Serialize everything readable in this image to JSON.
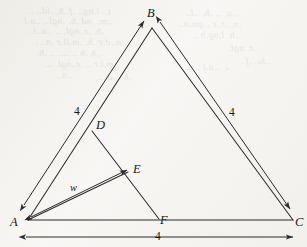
{
  "figure": {
    "kind": "geometry-diagram",
    "background_color": "#f7f6f4",
    "ink_color": "#2b2a2e",
    "vertices": [
      {
        "id": "A",
        "label": "A",
        "x": 28,
        "y": 220,
        "label_x": 10,
        "label_y": 216
      },
      {
        "id": "B",
        "label": "B",
        "x": 152,
        "y": 28,
        "label_x": 147,
        "label_y": 7
      },
      {
        "id": "C",
        "label": "C",
        "x": 293,
        "y": 220,
        "label_x": 295,
        "label_y": 216
      },
      {
        "id": "D",
        "label": "D",
        "x": 92,
        "y": 131,
        "label_x": 96,
        "label_y": 119
      },
      {
        "id": "E",
        "label": "E",
        "x": 128,
        "y": 172,
        "label_x": 133,
        "label_y": 163
      },
      {
        "id": "F",
        "label": "F",
        "x": 159,
        "y": 219,
        "label_x": 160,
        "label_y": 214
      }
    ],
    "edges": [
      {
        "name": "side-AB",
        "from": "A",
        "to": "B"
      },
      {
        "name": "side-BC",
        "from": "B",
        "to": "C"
      },
      {
        "name": "side-AC",
        "from": "A",
        "to": "C"
      },
      {
        "name": "segment-DF",
        "from": "D",
        "to": "F"
      },
      {
        "name": "segment-AE",
        "from": "A",
        "to": "E"
      }
    ],
    "dimensions": [
      {
        "name": "dimension-AB",
        "label": "4",
        "label_x": 74,
        "label_y": 106,
        "arrow": "double",
        "x1": 24,
        "y1": 205,
        "x2": 144,
        "y2": 21
      },
      {
        "name": "dimension-BC",
        "label": "4",
        "label_x": 229,
        "label_y": 107,
        "arrow": "double",
        "x1": 160,
        "y1": 22,
        "x2": 290,
        "y2": 209
      },
      {
        "name": "dimension-AC",
        "label": "4",
        "label_x": 155,
        "label_y": 231,
        "arrow": "double",
        "x1": 26,
        "y1": 237,
        "x2": 293,
        "y2": 237
      },
      {
        "name": "dimension-AE",
        "label": "w",
        "label_x": 70,
        "label_y": 183,
        "arrow": "double",
        "x1": 31,
        "y1": 217,
        "x2": 127,
        "y2": 170
      }
    ],
    "bleed_through_lines": [
      {
        "text": "t.. l.ng.. .f .h. .id.. ..",
        "x": 28,
        "y": 6,
        "rot": -0.6
      },
      {
        "text": "..m. .nd .h. .ngl.. ..u.l",
        "x": 24,
        "y": 16,
        "rot": -0.4
      },
      {
        "text": ".h. .r..ngl. ..  ..u..l.",
        "x": 30,
        "y": 26,
        "rot": -0.5
      },
      {
        "text": "..n..d.r .h. .m.ll.r .n..",
        "x": 40,
        "y": 37,
        "rot": -0.3
      },
      {
        "text": "..h..h .. .... .. .h.",
        "x": 36,
        "y": 48,
        "rot": -0.4
      },
      {
        "text": "..m.l.r .. .r..ngl. ...",
        "x": 44,
        "y": 59,
        "rot": -0.3
      },
      {
        "text": "..n..",
        "x": 56,
        "y": 70,
        "rot": -0.3
      },
      {
        "text": "..u. .. .h. ..l..",
        "x": 185,
        "y": 8,
        "rot": -0.5
      },
      {
        "text": ".n...r..r ..gm.n..",
        "x": 178,
        "y": 19,
        "rot": -0.4
      },
      {
        "text": ".h. l.ng.h ..",
        "x": 192,
        "y": 30,
        "rot": -0.4
      },
      {
        "text": ".r..ngl.",
        "x": 228,
        "y": 43,
        "rot": -0.3
      },
      {
        "text": "..lu. .f .",
        "x": 240,
        "y": 56,
        "rot": -0.3
      },
      {
        "text": "..u.l .. ..",
        "x": 186,
        "y": 62,
        "rot": -0.3
      },
      {
        "text": ".h. ..d. ..",
        "x": 96,
        "y": 72,
        "rot": -0.3
      }
    ]
  }
}
